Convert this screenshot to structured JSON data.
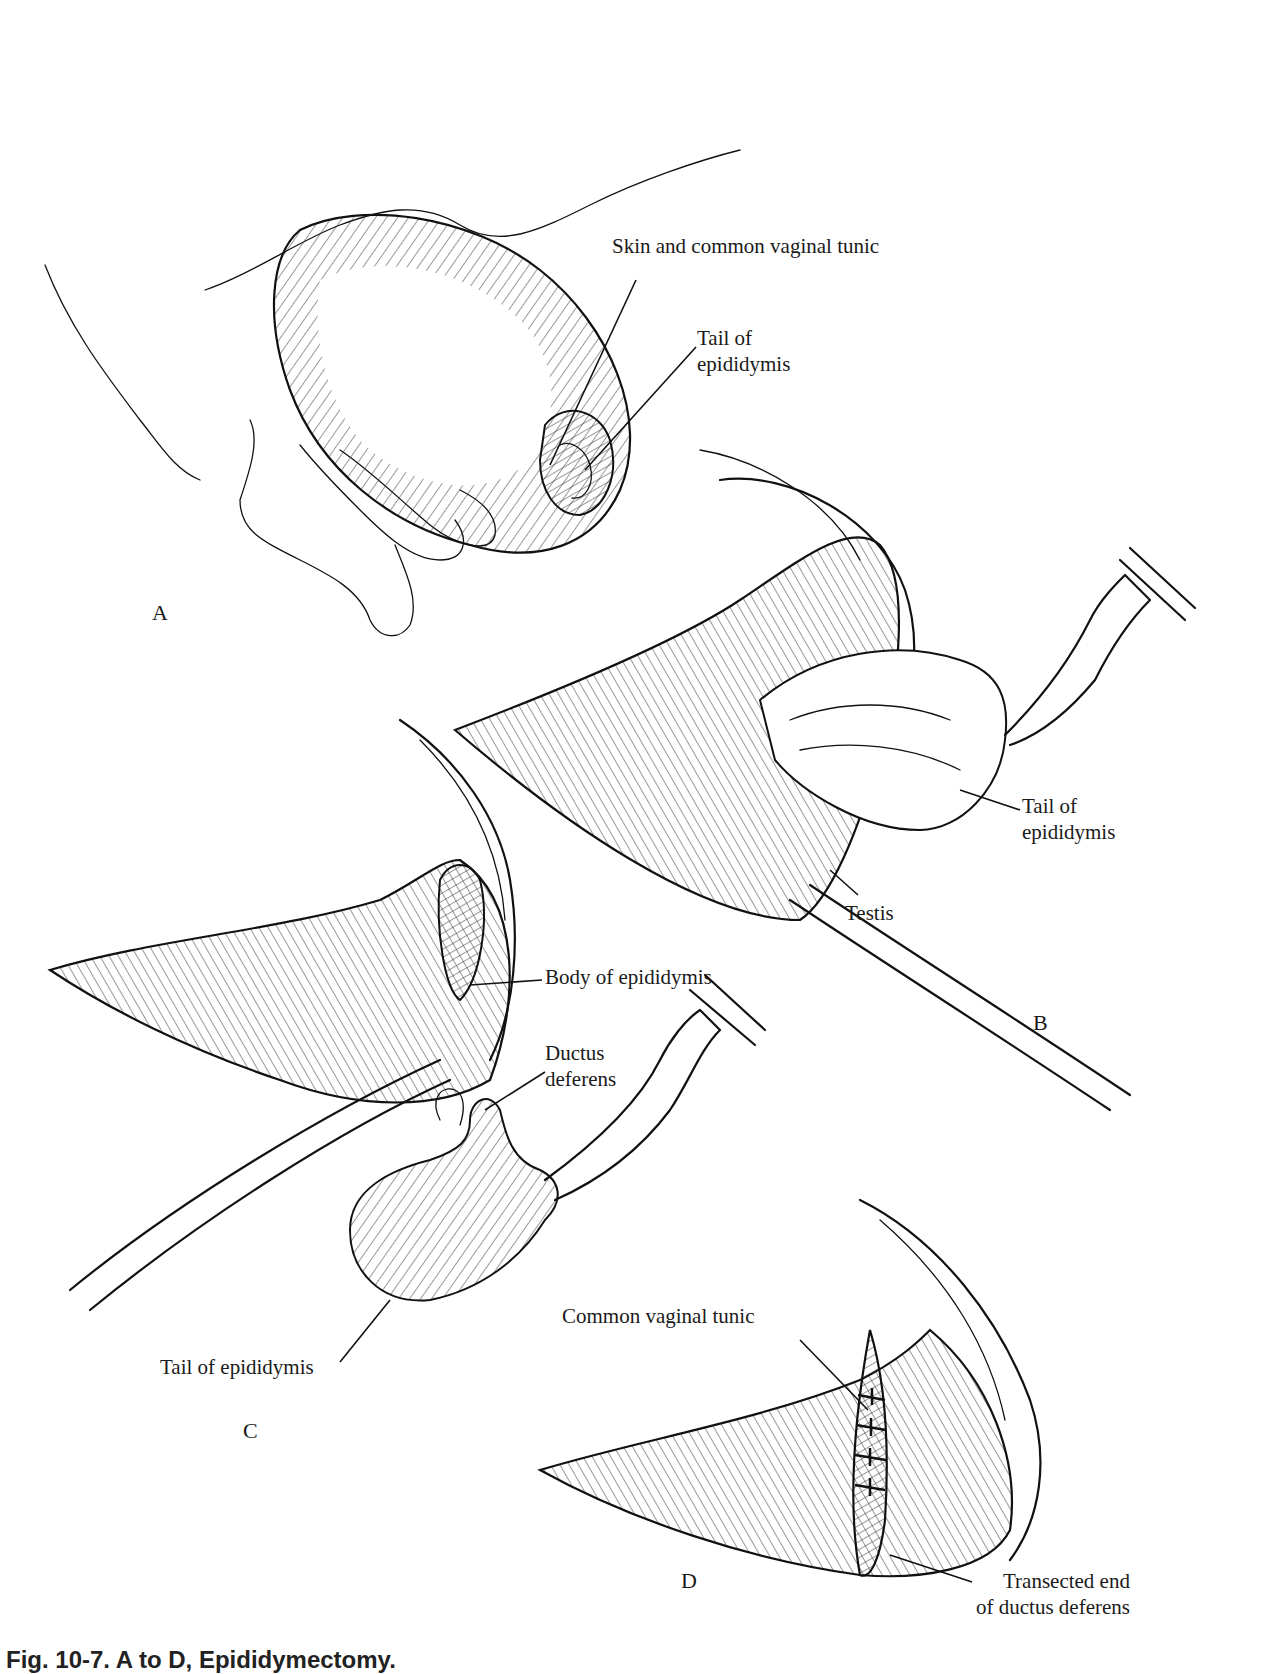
{
  "figure": {
    "caption": "Fig. 10-7. A to D, Epididymectomy.",
    "caption_note": "caption partially clipped at bottom edge of image",
    "panels": [
      {
        "id": "A",
        "letter": "A",
        "labels": [
          {
            "text": "Skin and common vaginal tunic"
          },
          {
            "text": "Tail of\nepididymis",
            "line1": "Tail of",
            "line2": "epididymis"
          }
        ]
      },
      {
        "id": "B",
        "letter": "B",
        "labels": [
          {
            "text": "Tail of\nepididymis",
            "line1": "Tail of",
            "line2": "epididymis"
          },
          {
            "text": "Testis"
          }
        ]
      },
      {
        "id": "C",
        "letter": "C",
        "labels": [
          {
            "text": "Body of epididymis"
          },
          {
            "text": "Ductus\ndeferens",
            "line1": "Ductus",
            "line2": "deferens"
          },
          {
            "text": "Tail of epididymis"
          }
        ]
      },
      {
        "id": "D",
        "letter": "D",
        "labels": [
          {
            "text": "Common vaginal tunic"
          },
          {
            "text": "Transected end\nof ductus deferens",
            "line1": "Transected end",
            "line2": "of ductus deferens"
          }
        ]
      }
    ]
  }
}
